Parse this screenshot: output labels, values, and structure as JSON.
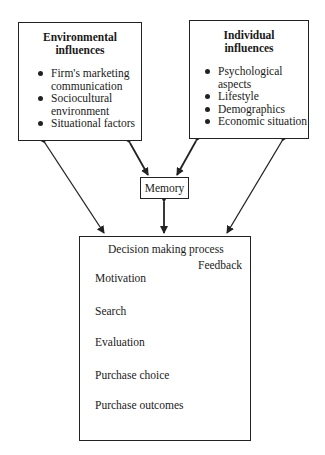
{
  "environmental": {
    "title_line1": "Environmental",
    "title_line2": "influences",
    "items": [
      "Firm's marketing communication",
      "Sociocultural environment",
      "Situational factors"
    ]
  },
  "individual": {
    "title_line1": "Individual",
    "title_line2": "influences",
    "items": [
      "Psychological aspects",
      "Lifestyle",
      "Demographics",
      "Economic situation"
    ]
  },
  "memory": {
    "label": "Memory"
  },
  "decision": {
    "title": "Decision making process",
    "feedback_label": "Feedback",
    "steps": [
      "Motivation",
      "Search",
      "Evaluation",
      "Purchase choice",
      "Purchase outcomes"
    ]
  }
}
